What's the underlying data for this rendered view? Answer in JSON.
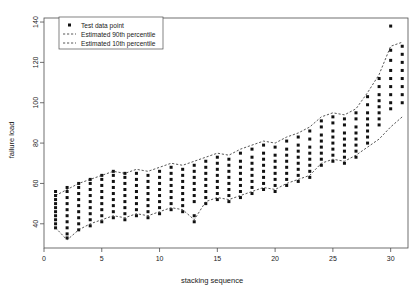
{
  "chart_data": {
    "type": "scatter",
    "title": "",
    "xlabel": "stacking sequence",
    "ylabel": "failure load",
    "xlim": [
      0,
      31.5
    ],
    "ylim": [
      28,
      142
    ],
    "xticks": [
      0,
      5,
      10,
      15,
      20,
      25,
      30
    ],
    "yticks": [
      40,
      60,
      80,
      100,
      120,
      140
    ],
    "grid": false,
    "legend_position": "top-left",
    "legend": [
      {
        "label": "Test data point",
        "marker": "square",
        "style": "point"
      },
      {
        "label": "Estimated 90th percentile",
        "marker": "line",
        "style": "dashed"
      },
      {
        "label": "Estimated 10th percentile",
        "marker": "line",
        "style": "dashed"
      }
    ],
    "series": [
      {
        "name": "Test data point",
        "type": "scatter",
        "points": [
          [
            1,
            48
          ],
          [
            1,
            50
          ],
          [
            1,
            52
          ],
          [
            1,
            44
          ],
          [
            1,
            46
          ],
          [
            1,
            54
          ],
          [
            1,
            42
          ],
          [
            1,
            56
          ],
          [
            1,
            40
          ],
          [
            1,
            38
          ],
          [
            2,
            47
          ],
          [
            2,
            50
          ],
          [
            2,
            53
          ],
          [
            2,
            56
          ],
          [
            2,
            44
          ],
          [
            2,
            41
          ],
          [
            2,
            38
          ],
          [
            2,
            35
          ],
          [
            2,
            33
          ],
          [
            2,
            58
          ],
          [
            3,
            52
          ],
          [
            3,
            55
          ],
          [
            3,
            49
          ],
          [
            3,
            46
          ],
          [
            3,
            43
          ],
          [
            3,
            58
          ],
          [
            3,
            40
          ],
          [
            3,
            60
          ],
          [
            3,
            37
          ],
          [
            4,
            54
          ],
          [
            4,
            57
          ],
          [
            4,
            51
          ],
          [
            4,
            48
          ],
          [
            4,
            45
          ],
          [
            4,
            60
          ],
          [
            4,
            42
          ],
          [
            4,
            62
          ],
          [
            4,
            39
          ],
          [
            5,
            56
          ],
          [
            5,
            59
          ],
          [
            5,
            53
          ],
          [
            5,
            50
          ],
          [
            5,
            47
          ],
          [
            5,
            62
          ],
          [
            5,
            44
          ],
          [
            5,
            64
          ],
          [
            5,
            41
          ],
          [
            6,
            58
          ],
          [
            6,
            61
          ],
          [
            6,
            55
          ],
          [
            6,
            52
          ],
          [
            6,
            49
          ],
          [
            6,
            64
          ],
          [
            6,
            46
          ],
          [
            6,
            66
          ],
          [
            6,
            43
          ],
          [
            7,
            57
          ],
          [
            7,
            60
          ],
          [
            7,
            54
          ],
          [
            7,
            51
          ],
          [
            7,
            48
          ],
          [
            7,
            63
          ],
          [
            7,
            45
          ],
          [
            7,
            65
          ],
          [
            7,
            42
          ],
          [
            8,
            59
          ],
          [
            8,
            62
          ],
          [
            8,
            56
          ],
          [
            8,
            53
          ],
          [
            8,
            50
          ],
          [
            8,
            65
          ],
          [
            8,
            47
          ],
          [
            8,
            44
          ],
          [
            9,
            58
          ],
          [
            9,
            61
          ],
          [
            9,
            55
          ],
          [
            9,
            52
          ],
          [
            9,
            49
          ],
          [
            9,
            64
          ],
          [
            9,
            46
          ],
          [
            9,
            43
          ],
          [
            10,
            60
          ],
          [
            10,
            63
          ],
          [
            10,
            57
          ],
          [
            10,
            54
          ],
          [
            10,
            51
          ],
          [
            10,
            66
          ],
          [
            10,
            48
          ],
          [
            10,
            45
          ],
          [
            11,
            62
          ],
          [
            11,
            65
          ],
          [
            11,
            59
          ],
          [
            11,
            56
          ],
          [
            11,
            53
          ],
          [
            11,
            68
          ],
          [
            11,
            50
          ],
          [
            11,
            47
          ],
          [
            12,
            61
          ],
          [
            12,
            64
          ],
          [
            12,
            58
          ],
          [
            12,
            55
          ],
          [
            12,
            52
          ],
          [
            12,
            67
          ],
          [
            12,
            49
          ],
          [
            12,
            46
          ],
          [
            13,
            63
          ],
          [
            13,
            66
          ],
          [
            13,
            60
          ],
          [
            13,
            57
          ],
          [
            13,
            54
          ],
          [
            13,
            69
          ],
          [
            13,
            51
          ],
          [
            13,
            44
          ],
          [
            13,
            41
          ],
          [
            14,
            65
          ],
          [
            14,
            68
          ],
          [
            14,
            62
          ],
          [
            14,
            59
          ],
          [
            14,
            56
          ],
          [
            14,
            71
          ],
          [
            14,
            53
          ],
          [
            14,
            50
          ],
          [
            15,
            67
          ],
          [
            15,
            70
          ],
          [
            15,
            64
          ],
          [
            15,
            61
          ],
          [
            15,
            58
          ],
          [
            15,
            73
          ],
          [
            15,
            55
          ],
          [
            15,
            52
          ],
          [
            16,
            66
          ],
          [
            16,
            69
          ],
          [
            16,
            63
          ],
          [
            16,
            60
          ],
          [
            16,
            57
          ],
          [
            16,
            72
          ],
          [
            16,
            54
          ],
          [
            16,
            51
          ],
          [
            17,
            68
          ],
          [
            17,
            71
          ],
          [
            17,
            65
          ],
          [
            17,
            62
          ],
          [
            17,
            59
          ],
          [
            17,
            75
          ],
          [
            17,
            56
          ],
          [
            17,
            53
          ],
          [
            18,
            70
          ],
          [
            18,
            73
          ],
          [
            18,
            67
          ],
          [
            18,
            64
          ],
          [
            18,
            61
          ],
          [
            18,
            77
          ],
          [
            18,
            58
          ],
          [
            18,
            55
          ],
          [
            19,
            72
          ],
          [
            19,
            75
          ],
          [
            19,
            69
          ],
          [
            19,
            66
          ],
          [
            19,
            63
          ],
          [
            19,
            79
          ],
          [
            19,
            60
          ],
          [
            19,
            57
          ],
          [
            20,
            71
          ],
          [
            20,
            74
          ],
          [
            20,
            68
          ],
          [
            20,
            65
          ],
          [
            20,
            62
          ],
          [
            20,
            78
          ],
          [
            20,
            59
          ],
          [
            20,
            56
          ],
          [
            21,
            74
          ],
          [
            21,
            77
          ],
          [
            21,
            71
          ],
          [
            21,
            68
          ],
          [
            21,
            65
          ],
          [
            21,
            81
          ],
          [
            21,
            62
          ],
          [
            21,
            59
          ],
          [
            22,
            76
          ],
          [
            22,
            79
          ],
          [
            22,
            73
          ],
          [
            22,
            70
          ],
          [
            22,
            67
          ],
          [
            22,
            83
          ],
          [
            22,
            64
          ],
          [
            22,
            61
          ],
          [
            23,
            78
          ],
          [
            23,
            82
          ],
          [
            23,
            75
          ],
          [
            23,
            72
          ],
          [
            23,
            69
          ],
          [
            23,
            86
          ],
          [
            23,
            66
          ],
          [
            23,
            63
          ],
          [
            24,
            84
          ],
          [
            24,
            88
          ],
          [
            24,
            81
          ],
          [
            24,
            78
          ],
          [
            24,
            75
          ],
          [
            24,
            91
          ],
          [
            24,
            72
          ],
          [
            24,
            69
          ],
          [
            25,
            86
          ],
          [
            25,
            90
          ],
          [
            25,
            83
          ],
          [
            25,
            80
          ],
          [
            25,
            77
          ],
          [
            25,
            93
          ],
          [
            25,
            74
          ],
          [
            25,
            71
          ],
          [
            26,
            85
          ],
          [
            26,
            89
          ],
          [
            26,
            82
          ],
          [
            26,
            79
          ],
          [
            26,
            76
          ],
          [
            26,
            92
          ],
          [
            26,
            73
          ],
          [
            26,
            70
          ],
          [
            27,
            88
          ],
          [
            27,
            92
          ],
          [
            27,
            85
          ],
          [
            27,
            82
          ],
          [
            27,
            79
          ],
          [
            27,
            95
          ],
          [
            27,
            76
          ],
          [
            27,
            73
          ],
          [
            28,
            95
          ],
          [
            28,
            99
          ],
          [
            28,
            92
          ],
          [
            28,
            89
          ],
          [
            28,
            86
          ],
          [
            28,
            103
          ],
          [
            28,
            83
          ],
          [
            28,
            80
          ],
          [
            29,
            104
          ],
          [
            29,
            108
          ],
          [
            29,
            101
          ],
          [
            29,
            98
          ],
          [
            29,
            95
          ],
          [
            29,
            112
          ],
          [
            29,
            92
          ],
          [
            29,
            89
          ],
          [
            30,
            116
          ],
          [
            30,
            121
          ],
          [
            30,
            112
          ],
          [
            30,
            108
          ],
          [
            30,
            104
          ],
          [
            30,
            126
          ],
          [
            30,
            100
          ],
          [
            30,
            97
          ],
          [
            30,
            138
          ],
          [
            31,
            120
          ],
          [
            31,
            124
          ],
          [
            31,
            116
          ],
          [
            31,
            112
          ],
          [
            31,
            108
          ],
          [
            31,
            128
          ],
          [
            31,
            104
          ],
          [
            31,
            100
          ]
        ]
      },
      {
        "name": "Estimated 90th percentile",
        "type": "line",
        "style": "dashed",
        "points": [
          [
            1,
            54
          ],
          [
            2,
            57
          ],
          [
            3,
            60
          ],
          [
            4,
            62
          ],
          [
            5,
            64
          ],
          [
            6,
            66
          ],
          [
            7,
            65
          ],
          [
            8,
            67
          ],
          [
            9,
            66
          ],
          [
            10,
            68
          ],
          [
            11,
            70
          ],
          [
            12,
            69
          ],
          [
            13,
            71
          ],
          [
            14,
            73
          ],
          [
            15,
            75
          ],
          [
            16,
            74
          ],
          [
            17,
            77
          ],
          [
            18,
            79
          ],
          [
            19,
            81
          ],
          [
            20,
            80
          ],
          [
            21,
            83
          ],
          [
            22,
            85
          ],
          [
            23,
            88
          ],
          [
            24,
            93
          ],
          [
            25,
            95
          ],
          [
            26,
            94
          ],
          [
            27,
            97
          ],
          [
            28,
            105
          ],
          [
            29,
            114
          ],
          [
            30,
            128
          ],
          [
            31,
            130
          ]
        ]
      },
      {
        "name": "Estimated 10th percentile",
        "type": "line",
        "style": "dashed",
        "points": [
          [
            1,
            38
          ],
          [
            2,
            32
          ],
          [
            3,
            37
          ],
          [
            4,
            40
          ],
          [
            5,
            42
          ],
          [
            6,
            44
          ],
          [
            7,
            43
          ],
          [
            8,
            45
          ],
          [
            9,
            44
          ],
          [
            10,
            46
          ],
          [
            11,
            48
          ],
          [
            12,
            47
          ],
          [
            13,
            42
          ],
          [
            14,
            51
          ],
          [
            15,
            53
          ],
          [
            16,
            52
          ],
          [
            17,
            54
          ],
          [
            18,
            56
          ],
          [
            19,
            58
          ],
          [
            20,
            57
          ],
          [
            21,
            60
          ],
          [
            22,
            62
          ],
          [
            23,
            64
          ],
          [
            24,
            70
          ],
          [
            25,
            72
          ],
          [
            26,
            71
          ],
          [
            27,
            74
          ],
          [
            28,
            78
          ],
          [
            29,
            82
          ],
          [
            30,
            88
          ],
          [
            31,
            93
          ]
        ]
      }
    ]
  },
  "axes": {
    "x_title": "stacking sequence",
    "y_title": "failure load",
    "x_tick_labels": [
      "0",
      "5",
      "10",
      "15",
      "20",
      "25",
      "30"
    ],
    "y_tick_labels": [
      "40",
      "60",
      "80",
      "100",
      "120",
      "140"
    ]
  },
  "legend": {
    "item_0": "Test data point",
    "item_1": "Estimated 90th percentile",
    "item_2": "Estimated 10th percentile"
  },
  "colors": {
    "point": "#111111",
    "curve": "#2b2b2b",
    "axis": "#4d4d4d",
    "background": "#ffffff"
  }
}
